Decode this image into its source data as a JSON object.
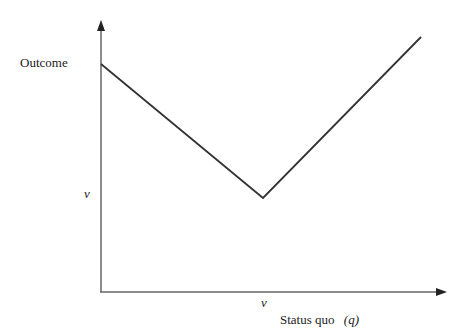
{
  "diagram": {
    "y_axis_label": "Outcome",
    "x_axis_label": "Status quo",
    "x_axis_variable": "(q)",
    "y_tick_label": "v",
    "x_tick_label": "v",
    "line_color": "#333333",
    "axis_color": "#555555",
    "curve_points": [
      [
        101,
        64
      ],
      [
        263,
        198
      ],
      [
        421,
        37
      ]
    ]
  }
}
